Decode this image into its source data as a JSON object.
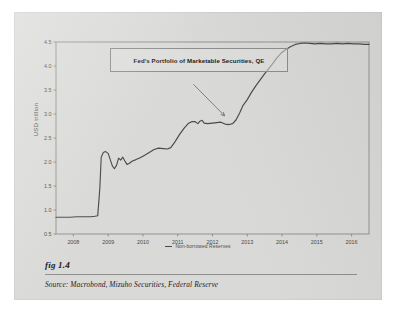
{
  "figure": {
    "fig_label": "fig 1.4",
    "source_text": "Source: Macrobond, Mizuho Securities, Federal Reserve"
  },
  "chart_data": {
    "type": "line",
    "title": "Fed's Portfolio of Marketable Securities, QE",
    "xlabel": "",
    "ylabel": "USD trillion",
    "xlim": [
      2007.5,
      2016.5
    ],
    "ylim": [
      0.5,
      4.5
    ],
    "xticks": [
      "2008",
      "2009",
      "2010",
      "2011",
      "2012",
      "2013",
      "2014",
      "2015",
      "2016"
    ],
    "yticks": [
      "0.5",
      "1.0",
      "1.5",
      "2.0",
      "2.5",
      "3.0",
      "3.5",
      "4.0",
      "4.5"
    ],
    "grid": false,
    "legend_position": "bottom-center",
    "annotation": {
      "text": "Fed's Portfolio of Marketable Securities, QE",
      "arrow_from_x": 2011.45,
      "arrow_from_y": 3.62,
      "arrow_to_x": 2012.35,
      "arrow_to_y": 2.96
    },
    "series": [
      {
        "name": "Non-borrowed Reserves",
        "color": "#4a4a4a",
        "points": [
          [
            2007.5,
            0.85
          ],
          [
            2007.7,
            0.85
          ],
          [
            2007.9,
            0.85
          ],
          [
            2008.1,
            0.86
          ],
          [
            2008.3,
            0.86
          ],
          [
            2008.5,
            0.86
          ],
          [
            2008.62,
            0.87
          ],
          [
            2008.7,
            0.88
          ],
          [
            2008.76,
            1.45
          ],
          [
            2008.8,
            2.1
          ],
          [
            2008.86,
            2.2
          ],
          [
            2008.92,
            2.22
          ],
          [
            2009.0,
            2.18
          ],
          [
            2009.06,
            2.05
          ],
          [
            2009.12,
            1.92
          ],
          [
            2009.18,
            1.86
          ],
          [
            2009.24,
            1.93
          ],
          [
            2009.3,
            2.08
          ],
          [
            2009.36,
            2.04
          ],
          [
            2009.42,
            2.1
          ],
          [
            2009.48,
            2.02
          ],
          [
            2009.54,
            1.95
          ],
          [
            2009.6,
            1.97
          ],
          [
            2009.7,
            2.02
          ],
          [
            2009.8,
            2.05
          ],
          [
            2009.92,
            2.09
          ],
          [
            2010.05,
            2.14
          ],
          [
            2010.18,
            2.2
          ],
          [
            2010.32,
            2.26
          ],
          [
            2010.45,
            2.29
          ],
          [
            2010.58,
            2.28
          ],
          [
            2010.7,
            2.27
          ],
          [
            2010.8,
            2.3
          ],
          [
            2010.92,
            2.42
          ],
          [
            2011.05,
            2.57
          ],
          [
            2011.18,
            2.7
          ],
          [
            2011.3,
            2.8
          ],
          [
            2011.4,
            2.84
          ],
          [
            2011.5,
            2.84
          ],
          [
            2011.58,
            2.8
          ],
          [
            2011.64,
            2.85
          ],
          [
            2011.7,
            2.87
          ],
          [
            2011.76,
            2.81
          ],
          [
            2011.86,
            2.8
          ],
          [
            2012.0,
            2.81
          ],
          [
            2012.12,
            2.82
          ],
          [
            2012.24,
            2.83
          ],
          [
            2012.36,
            2.79
          ],
          [
            2012.48,
            2.78
          ],
          [
            2012.58,
            2.8
          ],
          [
            2012.68,
            2.88
          ],
          [
            2012.78,
            3.02
          ],
          [
            2012.88,
            3.18
          ],
          [
            2013.0,
            3.3
          ],
          [
            2013.12,
            3.45
          ],
          [
            2013.24,
            3.58
          ],
          [
            2013.36,
            3.7
          ],
          [
            2013.48,
            3.82
          ],
          [
            2013.6,
            3.93
          ],
          [
            2013.72,
            4.04
          ],
          [
            2013.84,
            4.16
          ],
          [
            2013.96,
            4.26
          ],
          [
            2014.1,
            4.34
          ],
          [
            2014.24,
            4.4
          ],
          [
            2014.38,
            4.45
          ],
          [
            2014.52,
            4.47
          ],
          [
            2014.66,
            4.48
          ],
          [
            2014.8,
            4.47
          ],
          [
            2014.94,
            4.46
          ],
          [
            2015.1,
            4.47
          ],
          [
            2015.26,
            4.46
          ],
          [
            2015.42,
            4.46
          ],
          [
            2015.58,
            4.47
          ],
          [
            2015.74,
            4.46
          ],
          [
            2015.9,
            4.47
          ],
          [
            2016.06,
            4.46
          ],
          [
            2016.22,
            4.46
          ],
          [
            2016.38,
            4.45
          ],
          [
            2016.5,
            4.45
          ]
        ]
      }
    ]
  }
}
